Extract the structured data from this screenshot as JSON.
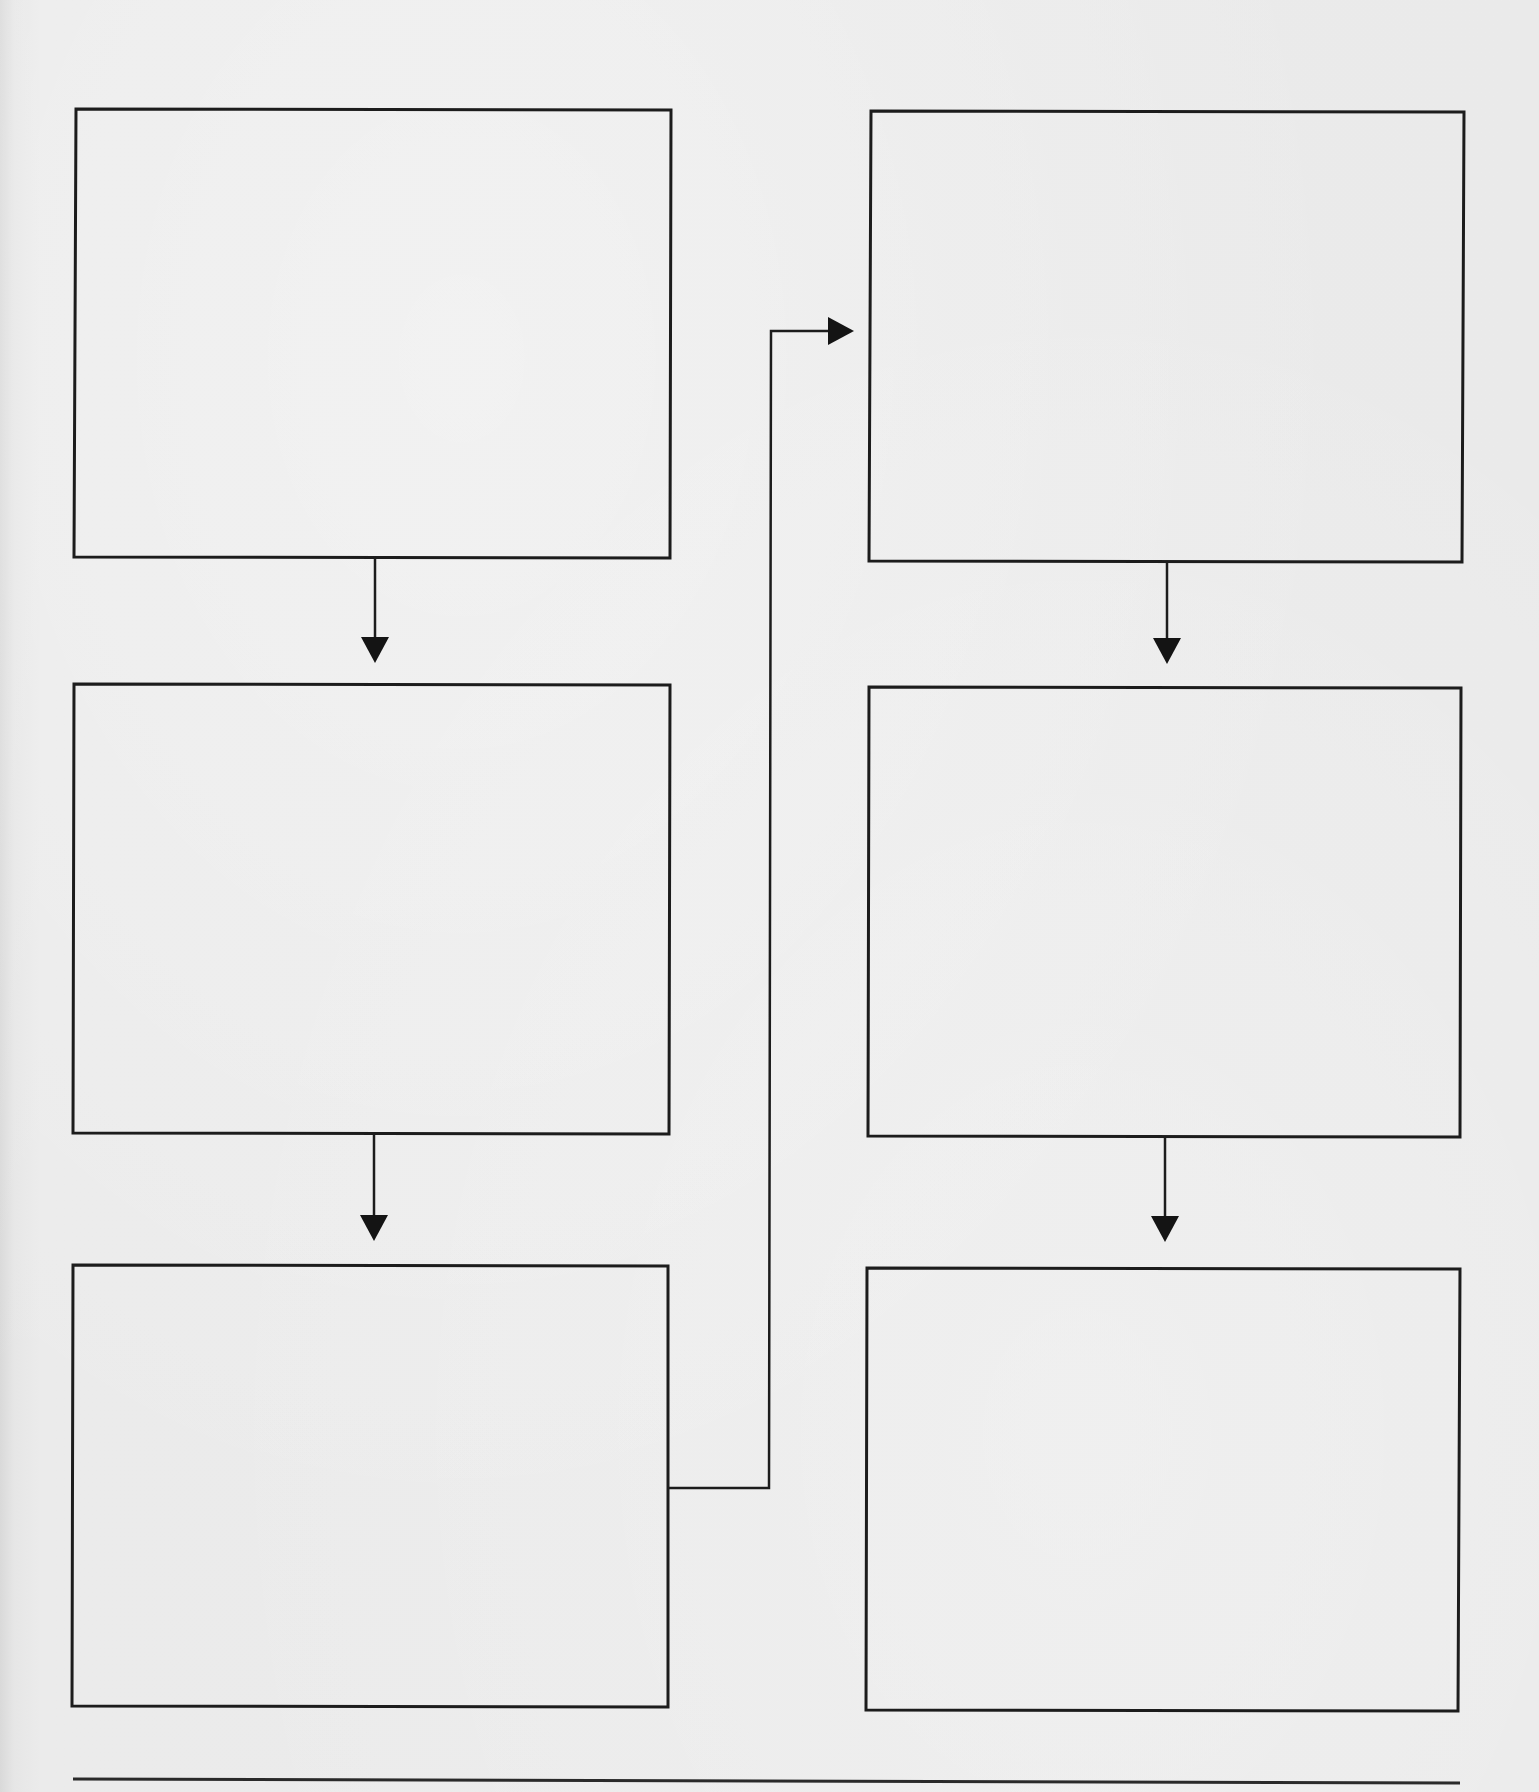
{
  "diagram": {
    "type": "flowchart-worksheet",
    "colors": {
      "paper": "#eaeaea",
      "ink": "#1c1c1c"
    },
    "boxes": [
      {
        "id": "box-1",
        "column": "left",
        "row": 1,
        "label": ""
      },
      {
        "id": "box-2",
        "column": "left",
        "row": 2,
        "label": ""
      },
      {
        "id": "box-3",
        "column": "left",
        "row": 3,
        "label": ""
      },
      {
        "id": "box-4",
        "column": "right",
        "row": 1,
        "label": ""
      },
      {
        "id": "box-5",
        "column": "right",
        "row": 2,
        "label": ""
      },
      {
        "id": "box-6",
        "column": "right",
        "row": 3,
        "label": ""
      }
    ],
    "edges": [
      {
        "from": "box-1",
        "to": "box-2",
        "style": "straight-down"
      },
      {
        "from": "box-2",
        "to": "box-3",
        "style": "straight-down"
      },
      {
        "from": "box-3",
        "to": "box-4",
        "style": "elbow"
      },
      {
        "from": "box-4",
        "to": "box-5",
        "style": "straight-down"
      },
      {
        "from": "box-5",
        "to": "box-6",
        "style": "straight-down"
      }
    ],
    "footer_rule": true
  }
}
